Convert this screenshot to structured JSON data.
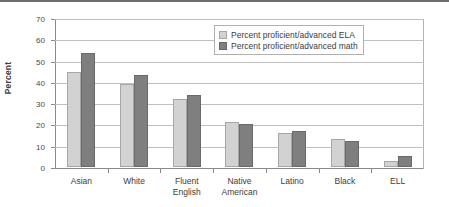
{
  "chart_data": {
    "type": "bar",
    "title": "",
    "subtitle": "",
    "xlabel": "",
    "ylabel": "Percent",
    "ylim": [
      0,
      70
    ],
    "ytick_step": 10,
    "ytick_labels": [
      "0",
      "10",
      "20",
      "30",
      "40",
      "50",
      "60",
      "70"
    ],
    "grid": true,
    "legend_position": "top-right",
    "categories": [
      "Asian",
      "White",
      "Fluent\nEnglish",
      "Native\nAmerican",
      "Latino",
      "Black",
      "ELL"
    ],
    "series": [
      {
        "name": "Percent proficient/advanced ELA",
        "color": "#d2d2d2",
        "values": [
          44.5,
          39,
          32,
          21,
          16,
          13,
          3
        ]
      },
      {
        "name": "Percent proficient/advanced math",
        "color": "#7f7f7f",
        "values": [
          53.5,
          43,
          34,
          20,
          17,
          12,
          5
        ]
      }
    ]
  },
  "legend": {
    "items": [
      {
        "label": "Percent proficient/advanced ELA",
        "swatch": "ela"
      },
      {
        "label": "Percent proficient/advanced math",
        "swatch": "math"
      }
    ]
  }
}
